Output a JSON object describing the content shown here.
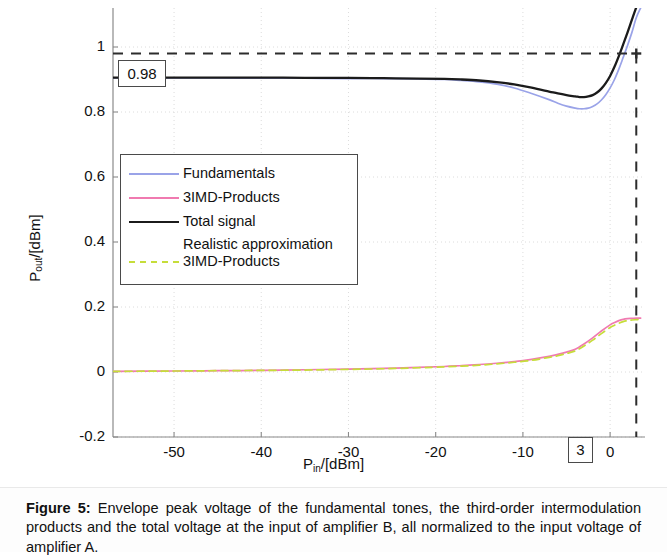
{
  "figure": {
    "caption_label": "Figure 5:",
    "caption_text": " Envelope peak voltage of the fundamental tones, the third-order intermodulation products and the total voltage at the input of amplifier B, all normalized to the input voltage of amplifier A."
  },
  "annotations": {
    "y_marker": "0.98",
    "x_marker": "3"
  },
  "axis": {
    "y_title_main": "P",
    "y_title_sub": "out",
    "y_title_rest": "/[dBm]",
    "x_title_main": "P",
    "x_title_sub": "in",
    "x_title_rest": "/[dBm]"
  },
  "chart_data": {
    "type": "line",
    "title": "",
    "xlabel": "P_in/[dBm]",
    "ylabel": "P_out/[dBm]",
    "xlim": [
      -57,
      4
    ],
    "ylim": [
      -0.2,
      1.12
    ],
    "xticks": [
      -50,
      -40,
      -30,
      -20,
      -10,
      0
    ],
    "xtick_labels": [
      "-50",
      "-40",
      "-30",
      "-20",
      "-10",
      "0"
    ],
    "yticks": [
      -0.2,
      0,
      0.2,
      0.4,
      0.6,
      0.8,
      1
    ],
    "ytick_labels": [
      "-0.2",
      "0",
      "0.2",
      "0.4",
      "0.6",
      "0.8",
      "1"
    ],
    "grid": true,
    "legend_position": "upper left",
    "markers": {
      "horizontal_dashed_y": 0.98,
      "vertical_dashed_x": 3,
      "marker_point": [
        3,
        0.98
      ]
    },
    "series": [
      {
        "name": "Fundamentals",
        "color": "#9aa3e8",
        "style": "solid",
        "x": [
          -57,
          -50,
          -45,
          -40,
          -35,
          -30,
          -26,
          -22,
          -19,
          -17,
          -15,
          -13,
          -11,
          -9,
          -7,
          -6,
          -5,
          -4,
          -3.5,
          -3,
          -2.5,
          -2,
          -1.5,
          -1,
          -0.5,
          0,
          0.5,
          1,
          1.5,
          2,
          2.5,
          3,
          3.5
        ],
        "y": [
          0.905,
          0.905,
          0.905,
          0.904,
          0.904,
          0.903,
          0.903,
          0.902,
          0.9,
          0.897,
          0.893,
          0.886,
          0.874,
          0.857,
          0.838,
          0.827,
          0.818,
          0.812,
          0.81,
          0.81,
          0.812,
          0.817,
          0.825,
          0.837,
          0.853,
          0.874,
          0.9,
          0.932,
          0.968,
          1.005,
          1.045,
          1.09,
          1.12
        ]
      },
      {
        "name": "3IMD-Products",
        "color": "#f07ab0",
        "style": "solid",
        "x": [
          -57,
          -50,
          -45,
          -40,
          -35,
          -30,
          -26,
          -22,
          -19,
          -17,
          -15,
          -13,
          -11,
          -9,
          -7,
          -6,
          -5,
          -4,
          -3,
          -2,
          -1,
          0,
          0.5,
          1,
          1.5,
          2,
          2.5,
          3,
          3.5
        ],
        "y": [
          0.002,
          0.003,
          0.004,
          0.005,
          0.007,
          0.009,
          0.011,
          0.014,
          0.017,
          0.02,
          0.023,
          0.027,
          0.032,
          0.039,
          0.048,
          0.054,
          0.061,
          0.07,
          0.086,
          0.105,
          0.126,
          0.145,
          0.152,
          0.158,
          0.162,
          0.164,
          0.165,
          0.166,
          0.166
        ]
      },
      {
        "name": "Total signal",
        "color": "#1b1b1b",
        "style": "solid",
        "x": [
          -57,
          -50,
          -45,
          -40,
          -35,
          -30,
          -26,
          -22,
          -19,
          -17,
          -15,
          -13,
          -11,
          -9,
          -7,
          -6,
          -5,
          -4,
          -3.5,
          -3,
          -2.5,
          -2,
          -1.5,
          -1,
          -0.5,
          0,
          0.5,
          1,
          1.5,
          2,
          2.5,
          3,
          3.3
        ],
        "y": [
          0.906,
          0.906,
          0.906,
          0.906,
          0.905,
          0.905,
          0.904,
          0.903,
          0.902,
          0.9,
          0.897,
          0.892,
          0.885,
          0.875,
          0.863,
          0.857,
          0.852,
          0.848,
          0.846,
          0.846,
          0.848,
          0.852,
          0.86,
          0.872,
          0.889,
          0.911,
          0.939,
          0.972,
          1.008,
          1.045,
          1.084,
          1.122,
          1.14
        ]
      },
      {
        "name": "Realistic approximation 3IMD-Products",
        "color": "#c6dd3a",
        "style": "dashed",
        "x": [
          -57,
          -50,
          -45,
          -40,
          -35,
          -30,
          -26,
          -22,
          -19,
          -17,
          -15,
          -13,
          -11,
          -9,
          -7,
          -6,
          -5,
          -4,
          -3,
          -2,
          -1,
          0,
          0.5,
          1,
          1.5,
          2,
          2.5,
          3,
          3.5
        ],
        "y": [
          0.002,
          0.003,
          0.004,
          0.005,
          0.006,
          0.008,
          0.01,
          0.013,
          0.016,
          0.018,
          0.021,
          0.025,
          0.03,
          0.036,
          0.045,
          0.05,
          0.057,
          0.065,
          0.08,
          0.098,
          0.118,
          0.137,
          0.144,
          0.15,
          0.155,
          0.158,
          0.16,
          0.161,
          0.162
        ]
      }
    ]
  },
  "legend": {
    "items": [
      {
        "label": "Fundamentals",
        "color": "#9aa3e8",
        "style": "solid",
        "lines": 1
      },
      {
        "label": "3IMD-Products",
        "color": "#f07ab0",
        "style": "solid",
        "lines": 1
      },
      {
        "label": "Total signal",
        "color": "#1b1b1b",
        "style": "solid",
        "lines": 1
      },
      {
        "label": "Realistic approximation\n3IMD-Products",
        "color": "#c6dd3a",
        "style": "dashed",
        "lines": 2
      }
    ]
  }
}
